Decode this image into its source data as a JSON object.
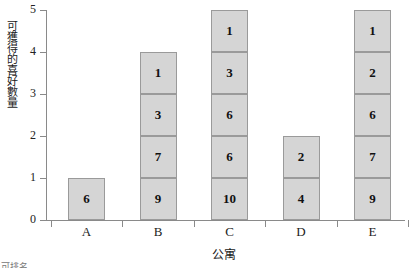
{
  "chart_data": {
    "type": "bar",
    "subtype": "stacked-bar",
    "title": "",
    "xlabel": "公寓",
    "ylabel": "可獲得的喜好數量",
    "categories": [
      "A",
      "B",
      "C",
      "D",
      "E"
    ],
    "values": [
      1,
      4,
      5,
      2,
      5
    ],
    "ylim": [
      0,
      5
    ],
    "yticks": [
      "0",
      "1",
      "2",
      "3",
      "4",
      "5"
    ],
    "xticks": [
      "A",
      "B",
      "C",
      "D",
      "E"
    ],
    "grid": false,
    "legend": "none",
    "segment_labels_note": "each stacked segment is 1 unit tall and carries a numeric label, listed bottom-to-top",
    "stacks": [
      {
        "category": "A",
        "total": 1,
        "segment_labels": [
          "6"
        ]
      },
      {
        "category": "B",
        "total": 4,
        "segment_labels": [
          "9",
          "7",
          "3",
          "1"
        ]
      },
      {
        "category": "C",
        "total": 5,
        "segment_labels": [
          "10",
          "6",
          "6",
          "3",
          "1"
        ]
      },
      {
        "category": "D",
        "total": 2,
        "segment_labels": [
          "4",
          "2"
        ]
      },
      {
        "category": "E",
        "total": 5,
        "segment_labels": [
          "9",
          "7",
          "6",
          "2",
          "1"
        ]
      }
    ],
    "colors": {
      "bar_fill": "#d5d5d5",
      "bar_border": "#9a9a9a",
      "axis": "#8a8a8a",
      "text": "#1a1a1a"
    }
  },
  "bottom_caption": "可排名"
}
